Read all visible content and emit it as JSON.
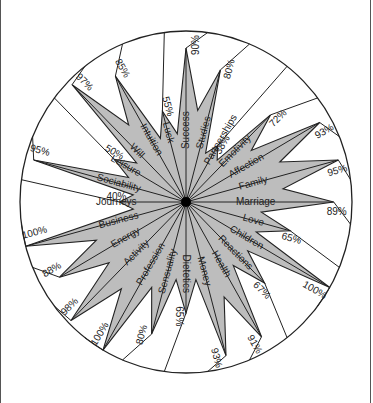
{
  "chart_data": {
    "type": "radar",
    "title": "",
    "center": {
      "x": 186,
      "y": 202
    },
    "radius": {
      "rx": 166,
      "ry": 171
    },
    "start_angle_deg": 0,
    "direction": "clockwise",
    "fill_color": "#bdbdbd",
    "line_color": "#222222",
    "center_dot_color": "#000000",
    "categories": [
      "Success",
      "Studies",
      "Partnerships",
      "Emotivity",
      "Affection",
      "Family",
      "Marriage",
      "Love",
      "Children",
      "Reactions",
      "Health",
      "Money",
      "Dietetics",
      "Sensuality",
      "Profession",
      "Activity",
      "Energy",
      "Business",
      "Journeys",
      "Sociability",
      "Leisure",
      "Will",
      "Intuition",
      "Luck"
    ],
    "values": [
      90,
      80,
      38,
      72,
      93,
      95,
      89,
      65,
      100,
      67,
      91,
      93,
      65,
      80,
      100,
      98,
      88,
      100,
      40,
      95,
      50,
      97,
      85,
      55
    ],
    "value_labels": [
      "90%",
      "80%",
      "38%",
      "72%",
      "93%",
      "95%",
      "89%",
      "65%",
      "100%",
      "67%",
      "91%",
      "93%",
      "65%",
      "80%",
      "100%",
      "98%",
      "88%",
      "100%",
      "40%",
      "95%",
      "50%",
      "97%",
      "85%",
      "55%"
    ],
    "range": [
      0,
      100
    ]
  }
}
